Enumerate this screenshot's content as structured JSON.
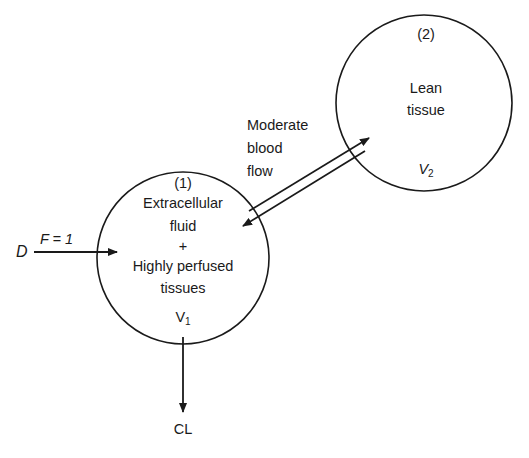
{
  "compartment1": {
    "number": "(1)",
    "line1": "Extracellular",
    "line2": "fluid",
    "line3": "+",
    "line4": "Highly perfused",
    "line5": "tissues",
    "volume_base": "V",
    "volume_sub": "1"
  },
  "compartment2": {
    "number": "(2)",
    "line1": "Lean",
    "line2": "tissue",
    "volume_base": "V",
    "volume_sub": "2"
  },
  "input": {
    "dose_label": "D",
    "bioavailability_label": "F = 1"
  },
  "exchange": {
    "line1": "Moderate",
    "line2": "blood",
    "line3": "flow"
  },
  "elimination": {
    "label": "CL"
  },
  "colors": {
    "stroke": "#1a1a1a",
    "background": "#ffffff"
  }
}
